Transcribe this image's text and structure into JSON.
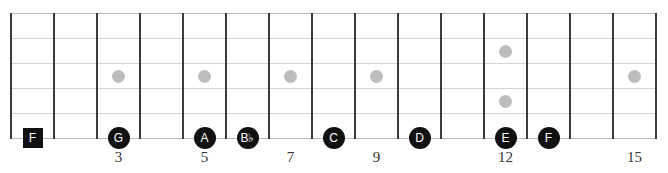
{
  "diagram": {
    "type": "guitar-fretboard",
    "strings": 6,
    "frets_shown": 15,
    "colors": {
      "fret": "#3a3a3a",
      "string": "#d4d4d4",
      "inlay": "#bdbdbd",
      "note": "#111111",
      "note_text": "#ffffff"
    },
    "inlays": [
      {
        "fret": 3,
        "string_gap": 3
      },
      {
        "fret": 5,
        "string_gap": 3
      },
      {
        "fret": 7,
        "string_gap": 3
      },
      {
        "fret": 9,
        "string_gap": 3
      },
      {
        "fret": 12,
        "string_gap": 2
      },
      {
        "fret": 12,
        "string_gap": 4
      },
      {
        "fret": 15,
        "string_gap": 3
      }
    ],
    "notes": [
      {
        "label": "F",
        "fret": 1,
        "string": 6,
        "shape": "square",
        "root": true
      },
      {
        "label": "G",
        "fret": 3,
        "string": 6,
        "shape": "circle"
      },
      {
        "label": "A",
        "fret": 5,
        "string": 6,
        "shape": "circle"
      },
      {
        "label": "B♭",
        "fret": 6,
        "string": 6,
        "shape": "circle"
      },
      {
        "label": "C",
        "fret": 8,
        "string": 6,
        "shape": "circle"
      },
      {
        "label": "D",
        "fret": 10,
        "string": 6,
        "shape": "circle"
      },
      {
        "label": "E",
        "fret": 12,
        "string": 6,
        "shape": "circle"
      },
      {
        "label": "F",
        "fret": 13,
        "string": 6,
        "shape": "circle"
      }
    ],
    "fret_numbers": [
      {
        "fret": 3,
        "label": "3"
      },
      {
        "fret": 5,
        "label": "5"
      },
      {
        "fret": 7,
        "label": "7"
      },
      {
        "fret": 9,
        "label": "9"
      },
      {
        "fret": 12,
        "label": "12"
      },
      {
        "fret": 15,
        "label": "15"
      }
    ]
  }
}
